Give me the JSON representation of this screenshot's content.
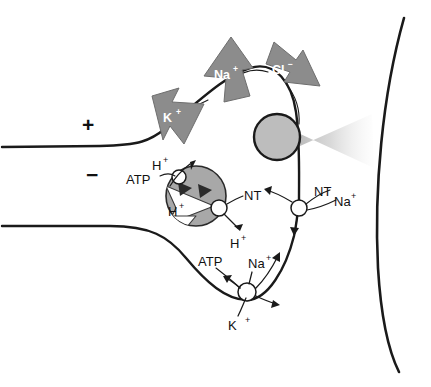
{
  "diagram": {
    "membrane_polarity": {
      "outside_label": "+",
      "inside_label": "−"
    },
    "ion_channel_arrows": [
      {
        "id": "k-efflux",
        "ion": "K",
        "charge": "+",
        "direction": "out",
        "color": "#8c8c8c"
      },
      {
        "id": "na-influx",
        "ion": "Na",
        "charge": "+",
        "direction": "in",
        "color": "#8c8c8c"
      },
      {
        "id": "cl-influx",
        "ion": "Cl",
        "charge": "−",
        "direction": "in",
        "color": "#8c8c8c"
      }
    ],
    "vesicle_transporters": {
      "proton_pump": {
        "label": "ATP",
        "transported": "H",
        "transported_charge": "+"
      },
      "nt_antiporter": {
        "label": "NT",
        "exchanged": "H",
        "exchanged_charge": "+"
      },
      "interior_proton": {
        "ion": "H",
        "charge": "+"
      }
    },
    "membrane_transporters": {
      "nt_sodium_symporter": {
        "nt_label": "NT",
        "ion_label": "Na",
        "ion_charge": "+"
      },
      "sodium_potassium_pump": {
        "atp_label": "ATP",
        "sodium_label": "Na",
        "sodium_charge": "+",
        "potassium_label": "K",
        "potassium_charge": "+"
      }
    },
    "release_site": {
      "vesicle_name": "fusing-vesicle",
      "plume_name": "neurotransmitter-release-plume",
      "vesicle_color": "#bdbdbd",
      "plume_color": "#cfcfcf"
    },
    "postsynaptic": {
      "name": "postsynaptic-membrane",
      "color": "#1a1a1a"
    }
  }
}
